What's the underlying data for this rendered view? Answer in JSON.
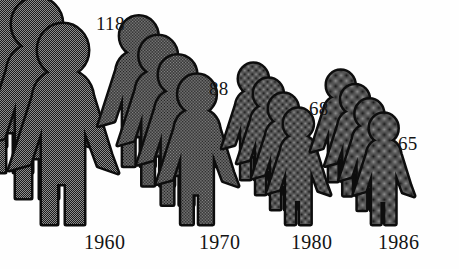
{
  "chart_data": {
    "type": "bar",
    "subtype": "pictogram",
    "title": "",
    "subtitle": "",
    "xlabel": "",
    "ylabel": "",
    "categories": [
      "1960",
      "1970",
      "1980",
      "1986"
    ],
    "values": [
      118,
      88,
      68,
      65
    ],
    "value_labels": [
      "118",
      "88",
      "68",
      "65"
    ],
    "tick_labels": [
      "1960",
      "1970",
      "1980",
      "1986"
    ],
    "legend": [],
    "annotations": [],
    "grid": false,
    "legend_position": "none",
    "ylim": [
      0,
      118
    ],
    "series": [
      {
        "name": "",
        "values": [
          118,
          88,
          68,
          65
        ]
      }
    ],
    "glyph": {
      "name": "person-figure",
      "count_per_group": 4,
      "fill_color": "#4a4a4a",
      "outline_color": "#111111",
      "texture": "halftone-dots"
    },
    "background_color": "#fefefe",
    "text_color": "#141414"
  },
  "groups": [
    {
      "id": "group-1960",
      "year": "1960",
      "value": "118",
      "value_num": 118,
      "figures": 4,
      "scale": 1.0,
      "baseline_x": 118,
      "value_label_x": 96,
      "value_label_y": 14,
      "year_label_x": 84,
      "year_label_y": 232
    },
    {
      "id": "group-1970",
      "year": "1970",
      "value": "88",
      "value_num": 88,
      "figures": 4,
      "scale": 0.746,
      "baseline_x": 238,
      "value_label_x": 209,
      "value_label_y": 79,
      "year_label_x": 199,
      "year_label_y": 232
    },
    {
      "id": "group-1980",
      "year": "1980",
      "value": "68",
      "value_num": 68,
      "figures": 4,
      "scale": 0.576,
      "baseline_x": 330,
      "value_label_x": 309,
      "value_label_y": 99,
      "year_label_x": 291,
      "year_label_y": 232
    },
    {
      "id": "group-1986",
      "year": "1986",
      "value": "65",
      "value_num": 65,
      "figures": 4,
      "scale": 0.551,
      "baseline_x": 414,
      "value_label_x": 398,
      "value_label_y": 134,
      "year_label_x": 378,
      "year_label_y": 232
    }
  ]
}
